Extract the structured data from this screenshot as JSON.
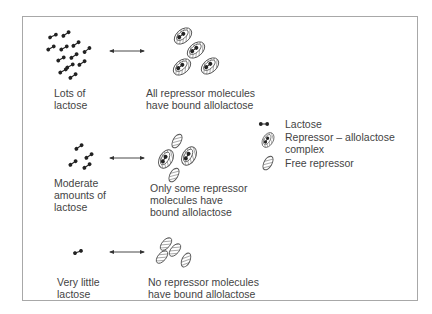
{
  "rows": [
    {
      "lactose_label": "Lots of\nlactose",
      "repressor_label": "All repressor molecules\nhave bound allolactose"
    },
    {
      "lactose_label": "Moderate\namounts of\nlactose",
      "repressor_label": "Only some repressor\nmolecules have\nbound allolactose"
    },
    {
      "lactose_label": "Very little\nlactose",
      "repressor_label": "No repressor molecules\nhave bound allolactose"
    }
  ],
  "legend": {
    "lactose": "Lactose",
    "complex": "Repressor – allolactose\ncomplex",
    "free": "Free repressor"
  },
  "colors": {
    "frame": "#a8a8a8",
    "ink": "#2a2a2a",
    "text": "#444444"
  }
}
